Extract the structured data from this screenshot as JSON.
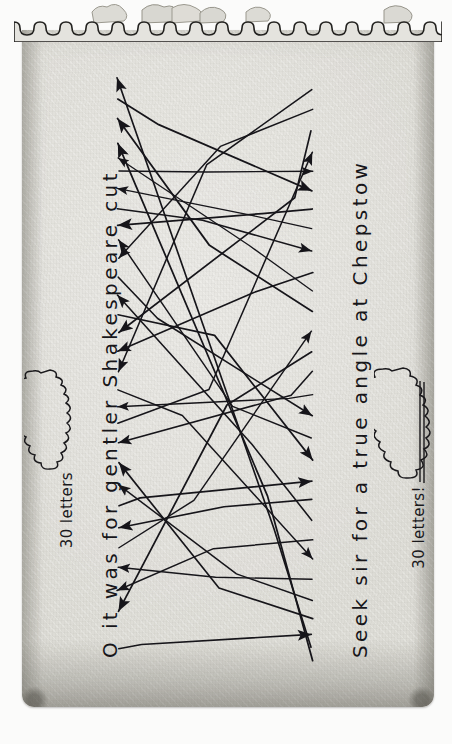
{
  "medium": {
    "surface": "torn notepad sheet",
    "paper_color": "#e4e3de",
    "ink_color": "#17161a",
    "edge_shadow_color": "#5a5850"
  },
  "phrases": {
    "left": {
      "text": "O it was for gentler Shakespeare cut",
      "orientation": "vertical-bottom-to-top",
      "letter_count_label": "30 letters"
    },
    "right": {
      "text": "Seek sir for a true angle at Chepstow",
      "orientation": "vertical-bottom-to-top",
      "letter_count_label": "30 letters!"
    }
  },
  "badges": {
    "left": {
      "label": "30 letters",
      "underlined": false
    },
    "right": {
      "label": "30 letters!",
      "underlined": true
    }
  },
  "chart_data": {
    "type": "diagram",
    "left_column_label": "O it was for gentler Shakespeare cut",
    "right_column_label": "Seek sir for a true angle at Chepstow",
    "left_letters": [
      "O",
      "i",
      "t",
      "w",
      "a",
      "s",
      "f",
      "o",
      "r",
      "g",
      "e",
      "n",
      "t",
      "l",
      "e",
      "r",
      "S",
      "h",
      "a",
      "k",
      "e",
      "s",
      "p",
      "e",
      "a",
      "r",
      "e",
      "c",
      "u",
      "t"
    ],
    "right_letters": [
      "S",
      "e",
      "e",
      "k",
      "s",
      "i",
      "r",
      "f",
      "o",
      "r",
      "a",
      "t",
      "r",
      "u",
      "e",
      "a",
      "n",
      "g",
      "l",
      "e",
      "a",
      "t",
      "C",
      "h",
      "e",
      "p",
      "s",
      "t",
      "o",
      "w"
    ],
    "arrow_count": 30,
    "arrow_direction": "right-phrase to left-phrase (arrowheads point left) plus returns pointing right",
    "left_anchors_y": [
      78,
      98,
      118,
      143,
      158,
      172,
      188,
      208,
      226,
      240,
      258,
      278,
      296,
      314,
      333,
      352,
      371,
      389,
      406,
      424,
      442,
      462,
      484,
      506,
      528,
      548,
      568,
      590,
      612,
      648
    ],
    "right_anchors_y": [
      90,
      110,
      130,
      152,
      172,
      190,
      208,
      228,
      250,
      272,
      292,
      312,
      332,
      352,
      372,
      394,
      416,
      438,
      460,
      482,
      500,
      520,
      540,
      560,
      580,
      600,
      618,
      634,
      648,
      660
    ],
    "pairs": [
      {
        "from": 0,
        "to": 28
      },
      {
        "from": 1,
        "to": 5
      },
      {
        "from": 2,
        "to": 11
      },
      {
        "from": 3,
        "to": 29
      },
      {
        "from": 4,
        "to": 10
      },
      {
        "from": 5,
        "to": 4
      },
      {
        "from": 6,
        "to": 7
      },
      {
        "from": 7,
        "to": 8
      },
      {
        "from": 8,
        "to": 6
      },
      {
        "from": 9,
        "to": 17
      },
      {
        "from": 10,
        "to": 1
      },
      {
        "from": 11,
        "to": 16
      },
      {
        "from": 12,
        "to": 21
      },
      {
        "from": 13,
        "to": 18
      },
      {
        "from": 14,
        "to": 2
      },
      {
        "from": 15,
        "to": 9
      },
      {
        "from": 16,
        "to": 0
      },
      {
        "from": 17,
        "to": 23
      },
      {
        "from": 18,
        "to": 15
      },
      {
        "from": 19,
        "to": 3
      },
      {
        "from": 20,
        "to": 14
      },
      {
        "from": 21,
        "to": 26
      },
      {
        "from": 22,
        "to": 25
      },
      {
        "from": 23,
        "to": 19
      },
      {
        "from": 24,
        "to": 20
      },
      {
        "from": 25,
        "to": 12
      },
      {
        "from": 26,
        "to": 24
      },
      {
        "from": 27,
        "to": 22
      },
      {
        "from": 28,
        "to": 13
      },
      {
        "from": 29,
        "to": 27
      }
    ]
  }
}
